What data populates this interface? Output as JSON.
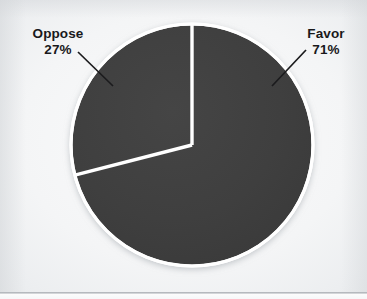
{
  "chart_data": {
    "type": "pie",
    "title": "",
    "categories": [
      "Favor",
      "Oppose"
    ],
    "values": [
      71,
      27
    ],
    "unit": "%",
    "labels": [
      "Favor\n71%",
      "Oppose\n27%"
    ],
    "legend": "none",
    "grid": false,
    "slice_color": "#3e3e3e",
    "divider_color": "#ffffff",
    "ring_color": "#ffffff",
    "background_color": "#f4f5f6",
    "label_text_color": "#19191b",
    "start_angle_deg": 0,
    "direction": "clockwise",
    "slices": [
      {
        "name": "Favor",
        "value": 71,
        "display_value": "71%",
        "color": "#3e3e3e",
        "start_angle_deg": 0,
        "end_angle_deg": 255.6
      },
      {
        "name": "Oppose",
        "value": 27,
        "display_value": "27%",
        "color": "#3e3e3e",
        "start_angle_deg": 262.8,
        "end_angle_deg": 360
      }
    ]
  },
  "figure": {
    "center": {
      "x": 192,
      "y": 145
    },
    "radius": 121,
    "labels": {
      "favor": {
        "name": "Favor",
        "percent": "71%"
      },
      "oppose": {
        "name": "Oppose",
        "percent": "27%"
      }
    },
    "leader_lines": [
      {
        "for": "oppose",
        "x1": 78,
        "y1": 52,
        "x2": 113,
        "y2": 86
      },
      {
        "for": "favor",
        "x1": 306,
        "y1": 50,
        "x2": 272,
        "y2": 86
      }
    ]
  }
}
